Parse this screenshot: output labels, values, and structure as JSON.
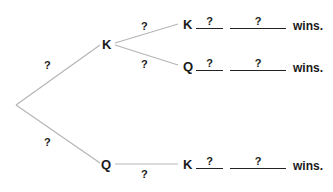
{
  "tree": {
    "root_branches": [
      {
        "label": "?",
        "node": "K"
      },
      {
        "label": "?",
        "node": "Q"
      }
    ],
    "k_branches": [
      {
        "label": "?",
        "node": "K"
      },
      {
        "label": "?",
        "node": "Q"
      }
    ],
    "q_branches": [
      {
        "label": "?",
        "node": "K"
      }
    ],
    "outcomes": [
      {
        "first": "K",
        "blank1": "?",
        "blank2": "?",
        "suffix": "wins."
      },
      {
        "first": "Q",
        "blank1": "?",
        "blank2": "?",
        "suffix": "wins."
      },
      {
        "first": "K",
        "blank1": "?",
        "blank2": "?",
        "suffix": "wins."
      }
    ]
  },
  "colors": {
    "line": "#b5b5b5",
    "text": "#1a1a1a"
  }
}
